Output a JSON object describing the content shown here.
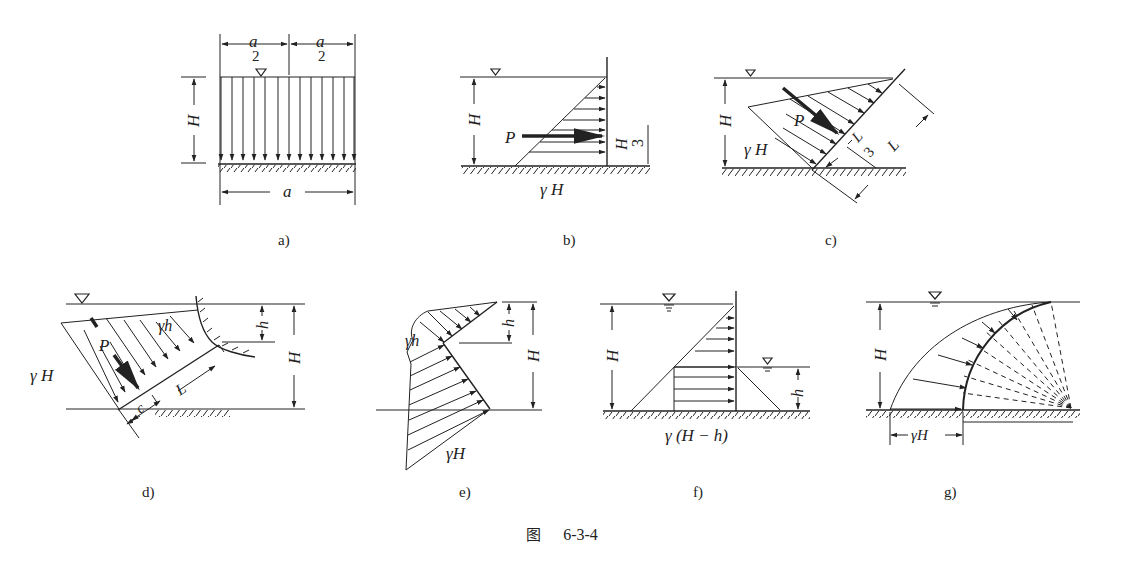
{
  "figure": {
    "caption_prefix": "图",
    "caption_number": "6-3-4"
  },
  "panels": [
    {
      "id": "a",
      "label": "a)",
      "texts": {
        "top_left": "a",
        "top_left_den": "2",
        "top_right": "a",
        "top_right_den": "2",
        "height": "H",
        "bottom": "a"
      }
    },
    {
      "id": "b",
      "label": "b)",
      "texts": {
        "force": "P",
        "height": "H",
        "arm_num": "H",
        "arm_den": "3",
        "base": "γ H"
      }
    },
    {
      "id": "c",
      "label": "c)",
      "texts": {
        "force": "P",
        "height": "H",
        "base": "γ H",
        "arm_num": "L",
        "arm_den": "3",
        "length": "L"
      }
    },
    {
      "id": "d",
      "label": "d)",
      "texts": {
        "force": "P",
        "top_pressure": "γh",
        "base": "γ H",
        "depth": "h",
        "height": "H",
        "length": "L",
        "offset": "c"
      }
    },
    {
      "id": "e",
      "label": "e)",
      "texts": {
        "top_pressure": "γh",
        "depth": "h",
        "height": "H",
        "base": "γH"
      }
    },
    {
      "id": "f",
      "label": "f)",
      "texts": {
        "height": "H",
        "tail_depth": "h",
        "base": "γ (H − h)"
      }
    },
    {
      "id": "g",
      "label": "g)",
      "texts": {
        "height": "H",
        "base": "γH"
      }
    }
  ],
  "colors": {
    "ink": "#222222",
    "background": "#ffffff"
  }
}
